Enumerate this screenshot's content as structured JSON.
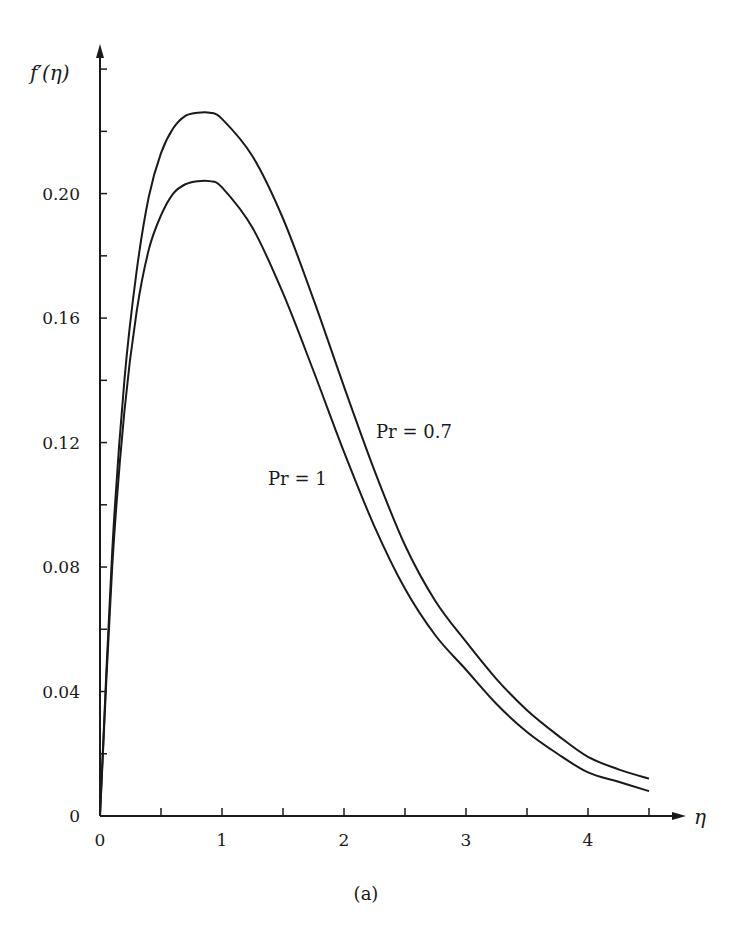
{
  "figure": {
    "caption": "(a)",
    "ylabel": "f′(η)",
    "xlabel": "η",
    "annotations": [
      {
        "text": "Pr = 0.7",
        "x_px": 376,
        "y_px": 438
      },
      {
        "text": "Pr = 1",
        "x_px": 268,
        "y_px": 485
      }
    ],
    "line_color": "#1a1a1a"
  },
  "chart_data": {
    "type": "line",
    "title": "",
    "xlabel": "η",
    "ylabel": "f′(η)",
    "xlim": [
      0,
      4.7
    ],
    "ylim": [
      0,
      0.24
    ],
    "grid": false,
    "legend_position": "inline annotations",
    "x_ticks": [
      0,
      1,
      2,
      3,
      4
    ],
    "x_minor_ticks": [
      0.5,
      1.5,
      2.5,
      3.5,
      4.5
    ],
    "y_ticks": [
      0,
      0.04,
      0.08,
      0.12,
      0.16,
      0.2
    ],
    "y_tick_labels": [
      "0",
      "0.04",
      "0.08",
      "0.12",
      "0.16",
      "0.20"
    ],
    "y_minor_ticks": [
      0.02,
      0.06,
      0.1,
      0.14,
      0.18,
      0.22,
      0.24
    ],
    "x": [
      0,
      0.1,
      0.2,
      0.3,
      0.4,
      0.5,
      0.6,
      0.7,
      0.8,
      0.9,
      1.0,
      1.25,
      1.5,
      1.75,
      2.0,
      2.25,
      2.5,
      2.75,
      3.0,
      3.25,
      3.5,
      3.75,
      4.0,
      4.25,
      4.5
    ],
    "series": [
      {
        "name": "Pr = 0.7",
        "values": [
          0,
          0.085,
          0.14,
          0.175,
          0.199,
          0.213,
          0.221,
          0.225,
          0.226,
          0.226,
          0.224,
          0.212,
          0.192,
          0.166,
          0.138,
          0.111,
          0.087,
          0.069,
          0.056,
          0.044,
          0.034,
          0.026,
          0.019,
          0.015,
          0.012
        ]
      },
      {
        "name": "Pr = 1",
        "values": [
          0,
          0.08,
          0.13,
          0.162,
          0.182,
          0.193,
          0.2,
          0.203,
          0.204,
          0.204,
          0.202,
          0.189,
          0.168,
          0.143,
          0.117,
          0.093,
          0.073,
          0.058,
          0.047,
          0.036,
          0.027,
          0.02,
          0.014,
          0.011,
          0.008
        ]
      }
    ]
  }
}
